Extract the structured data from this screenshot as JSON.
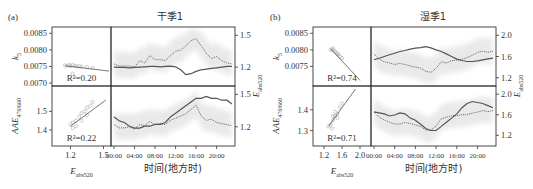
{
  "chart_data": [
    {
      "panel": "a",
      "panel_label": "(a)",
      "title": "干季1",
      "type": "scatter+line",
      "x_axis_time_label": "时间(地方时)",
      "time_ticks": [
        "00:00",
        "04:00",
        "08:00",
        "12:00",
        "16:00",
        "20:00"
      ],
      "rows": [
        {
          "ylabel": "k_5",
          "ylabel_main": "k",
          "ylabel_sub": "5",
          "ylim": [
            0.007,
            0.0086
          ],
          "yticks": [
            "0.0085",
            "0.0080",
            "0.0075",
            "0.0070"
          ],
          "ytick_values": [
            0.0085,
            0.008,
            0.0075,
            0.007
          ],
          "right_label_main": "E",
          "right_label_sub": "abs520",
          "right_ylim": [
            1.05,
            1.55
          ],
          "right_yticks": [
            "1.5",
            "1.2"
          ],
          "right_ytick_values": [
            1.5,
            1.2
          ],
          "r2_label": "R²=0.20",
          "scatter_xlim": [
            1.05,
            1.55
          ],
          "scatter": {
            "x": [
              1.15,
              1.17,
              1.19,
              1.2,
              1.22,
              1.24,
              1.26,
              1.28,
              1.3,
              1.35,
              1.4,
              1.22
            ],
            "y": [
              0.00753,
              0.00752,
              0.00755,
              0.00751,
              0.00754,
              0.00752,
              0.0075,
              0.00751,
              0.00749,
              0.00748,
              0.00746,
              0.00728
            ]
          },
          "fit": {
            "x": [
              1.15,
              1.55
            ],
            "y": [
              0.00752,
              0.00736
            ]
          },
          "time": [
            0,
            1,
            2,
            3,
            4,
            5,
            6,
            7,
            8,
            9,
            10,
            11,
            12,
            13,
            14,
            15,
            16,
            17,
            18,
            19,
            20,
            21,
            22,
            23
          ],
          "series_left": {
            "name": "k_5",
            "style": "solid",
            "values": [
              0.00748,
              0.00747,
              0.00747,
              0.00746,
              0.00747,
              0.00748,
              0.00749,
              0.0075,
              0.0075,
              0.00749,
              0.0075,
              0.00751,
              0.00749,
              0.0074,
              0.00725,
              0.00728,
              0.00735,
              0.0074,
              0.00742,
              0.00744,
              0.00746,
              0.00748,
              0.0075,
              0.0075
            ]
          },
          "series_right": {
            "name": "E_abs520",
            "style": "dotted",
            "values": [
              1.23,
              1.21,
              1.21,
              1.21,
              1.2,
              1.26,
              1.24,
              1.31,
              1.27,
              1.27,
              1.26,
              1.31,
              1.35,
              1.36,
              1.4,
              1.45,
              1.47,
              1.4,
              1.33,
              1.28,
              1.3,
              1.26,
              1.24,
              1.23
            ]
          }
        },
        {
          "ylabel": "AAE_470/660",
          "ylabel_main": "AAE",
          "ylabel_sub": "470/660",
          "ylim": [
            1.33,
            1.62
          ],
          "yticks": [
            "1.5",
            "1.4"
          ],
          "ytick_values": [
            1.5,
            1.4
          ],
          "right_label_main": "E",
          "right_label_sub": "abs520",
          "right_ylim": [
            1.05,
            1.55
          ],
          "right_yticks": [
            "1.5",
            "1.2"
          ],
          "right_ytick_values": [
            1.5,
            1.2
          ],
          "r2_label": "R²=0.22",
          "scatter_xlim": [
            1.05,
            1.55
          ],
          "xlabel": "E_abs520",
          "xlabel_main": "E",
          "xlabel_sub": "abs520",
          "xticks": [
            "1.2",
            "1.5"
          ],
          "xtick_values": [
            1.2,
            1.5
          ],
          "scatter": {
            "x": [
              1.2,
              1.22,
              1.25,
              1.28,
              1.3,
              1.33,
              1.35,
              1.38,
              1.4,
              1.25,
              1.3,
              1.35,
              1.22
            ],
            "y": [
              1.43,
              1.44,
              1.45,
              1.47,
              1.49,
              1.5,
              1.52,
              1.53,
              1.55,
              1.42,
              1.45,
              1.48,
              1.41
            ]
          },
          "fit": {
            "x": [
              1.2,
              1.52
            ],
            "y": [
              1.42,
              1.56
            ]
          },
          "time": [
            0,
            1,
            2,
            3,
            4,
            5,
            6,
            7,
            8,
            9,
            10,
            11,
            12,
            13,
            14,
            15,
            16,
            17,
            18,
            19,
            20,
            21,
            22,
            23
          ],
          "series_left": {
            "name": "AAE_470/660",
            "style": "solid",
            "values": [
              1.47,
              1.45,
              1.44,
              1.42,
              1.41,
              1.41,
              1.42,
              1.42,
              1.43,
              1.43,
              1.44,
              1.47,
              1.49,
              1.51,
              1.53,
              1.55,
              1.57,
              1.57,
              1.58,
              1.57,
              1.57,
              1.56,
              1.56,
              1.54
            ]
          },
          "series_right": {
            "name": "E_abs520",
            "style": "dotted",
            "values": [
              1.22,
              1.19,
              1.19,
              1.2,
              1.18,
              1.22,
              1.21,
              1.25,
              1.22,
              1.23,
              1.22,
              1.26,
              1.28,
              1.3,
              1.32,
              1.36,
              1.4,
              1.3,
              1.26,
              1.27,
              1.24,
              1.23,
              1.22,
              1.21
            ]
          }
        }
      ]
    },
    {
      "panel": "b",
      "panel_label": "(b)",
      "title": "湿季1",
      "type": "scatter+line",
      "x_axis_time_label": "时间(地方时)",
      "time_ticks": [
        "00:00",
        "04:00",
        "08:00",
        "12:00",
        "16:00",
        "20:00"
      ],
      "rows": [
        {
          "ylabel": "k_5",
          "ylabel_main": "k",
          "ylabel_sub": "5",
          "ylim": [
            0.007,
            0.0086
          ],
          "yticks": [
            "0.0085",
            "0.0080",
            "0.0075"
          ],
          "ytick_values": [
            0.0085,
            0.008,
            0.0075
          ],
          "right_label_main": "E",
          "right_label_sub": "abs520",
          "right_ylim": [
            1.1,
            2.1
          ],
          "right_yticks": [
            "2.0",
            "1.6",
            "1.2"
          ],
          "right_ytick_values": [
            2.0,
            1.6,
            1.2
          ],
          "r2_label": "R²=0.74",
          "scatter_xlim": [
            1.0,
            2.2
          ],
          "scatter": {
            "x": [
              1.35,
              1.4,
              1.42,
              1.45,
              1.48,
              1.5,
              1.55,
              1.6,
              1.38,
              1.52
            ],
            "y": [
              0.00801,
              0.00805,
              0.00798,
              0.00795,
              0.0079,
              0.00788,
              0.0078,
              0.00775,
              0.008,
              0.00785
            ]
          },
          "fit": {
            "x": [
              1.35,
              2.0
            ],
            "y": [
              0.00803,
              0.00708
            ]
          },
          "time": [
            0,
            1,
            2,
            3,
            4,
            5,
            6,
            7,
            8,
            9,
            10,
            11,
            12,
            13,
            14,
            15,
            16,
            17,
            18,
            19,
            20,
            21,
            22,
            23
          ],
          "series_left": {
            "name": "k_5",
            "style": "solid",
            "values": [
              0.0077,
              0.00775,
              0.0078,
              0.00785,
              0.0079,
              0.00795,
              0.00798,
              0.00802,
              0.00805,
              0.00807,
              0.0081,
              0.00806,
              0.008,
              0.00795,
              0.00788,
              0.0078,
              0.00772,
              0.00768,
              0.00765,
              0.00765,
              0.00767,
              0.0077,
              0.00773,
              0.00775
            ]
          },
          "series_right": {
            "name": "E_abs520",
            "style": "dotted",
            "values": [
              1.65,
              1.55,
              1.5,
              1.48,
              1.45,
              1.47,
              1.45,
              1.42,
              1.4,
              1.38,
              1.32,
              1.3,
              1.38,
              1.5,
              1.48,
              1.52,
              1.53,
              1.55,
              1.58,
              1.62,
              1.68,
              1.7,
              1.68,
              1.7
            ]
          }
        },
        {
          "ylabel": "AAE_470/660",
          "ylabel_main": "AAE",
          "ylabel_sub": "470/660",
          "ylim": [
            1.24,
            1.5
          ],
          "yticks": [
            "1.4",
            "1.3"
          ],
          "ytick_values": [
            1.4,
            1.3
          ],
          "right_label_main": "E",
          "right_label_sub": "abs520",
          "right_ylim": [
            1.05,
            2.1
          ],
          "right_yticks": [
            "2.0",
            "1.6",
            "1.2"
          ],
          "right_ytick_values": [
            2.0,
            1.6,
            1.2
          ],
          "r2_label": "R²=0.71",
          "scatter_xlim": [
            1.0,
            2.2
          ],
          "xlabel": "E_abs520",
          "xlabel_main": "E",
          "xlabel_sub": "abs520",
          "xticks": [
            "1.2",
            "1.6",
            "2.0"
          ],
          "xtick_values": [
            1.2,
            1.6,
            2.0
          ],
          "scatter": {
            "x": [
              1.3,
              1.35,
              1.4,
              1.45,
              1.5,
              1.55,
              1.6,
              1.4,
              1.45,
              1.5,
              1.38
            ],
            "y": [
              1.32,
              1.33,
              1.35,
              1.37,
              1.38,
              1.41,
              1.43,
              1.37,
              1.39,
              1.36,
              1.31
            ]
          },
          "fit": {
            "x": [
              1.3,
              1.9
            ],
            "y": [
              1.32,
              1.5
            ]
          },
          "time": [
            0,
            1,
            2,
            3,
            4,
            5,
            6,
            7,
            8,
            9,
            10,
            11,
            12,
            13,
            14,
            15,
            16,
            17,
            18,
            19,
            20,
            21,
            22,
            23
          ],
          "series_left": {
            "name": "AAE_470/660",
            "style": "solid",
            "values": [
              1.39,
              1.385,
              1.38,
              1.37,
              1.375,
              1.385,
              1.38,
              1.36,
              1.35,
              1.33,
              1.31,
              1.3,
              1.3,
              1.32,
              1.34,
              1.36,
              1.38,
              1.41,
              1.43,
              1.44,
              1.435,
              1.43,
              1.42,
              1.41
            ]
          },
          "series_right": {
            "name": "E_abs520",
            "style": "dotted",
            "values": [
              1.65,
              1.55,
              1.5,
              1.45,
              1.42,
              1.42,
              1.45,
              1.43,
              1.4,
              1.37,
              1.3,
              1.3,
              1.38,
              1.52,
              1.55,
              1.58,
              1.58,
              1.6,
              1.6,
              1.63,
              1.65,
              1.68,
              1.66,
              1.68
            ]
          }
        }
      ]
    }
  ]
}
